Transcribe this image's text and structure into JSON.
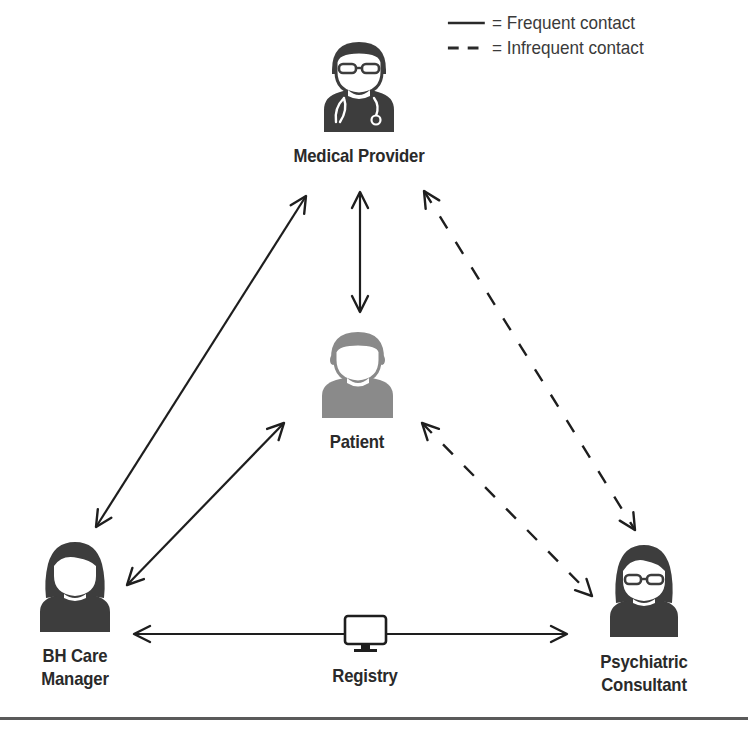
{
  "legend": {
    "items": [
      {
        "style": "solid",
        "label": "= Frequent contact"
      },
      {
        "style": "dashed",
        "label": "= Infrequent contact"
      }
    ]
  },
  "nodes": {
    "medical_provider": {
      "label": "Medical Provider",
      "icon": "doctor-with-stethoscope-icon"
    },
    "patient": {
      "label": "Patient",
      "icon": "person-icon"
    },
    "bh_care_manager": {
      "label_line1": "BH Care",
      "label_line2": "Manager",
      "icon": "woman-icon"
    },
    "psychiatric_consultant": {
      "label_line1": "Psychiatric",
      "label_line2": "Consultant",
      "icon": "woman-with-glasses-icon"
    },
    "registry": {
      "label": "Registry",
      "icon": "computer-monitor-icon"
    }
  },
  "edges": [
    {
      "from": "Medical Provider",
      "to": "Patient",
      "style": "solid",
      "direction": "bidirectional"
    },
    {
      "from": "Medical Provider",
      "to": "BH Care Manager",
      "style": "solid",
      "direction": "bidirectional"
    },
    {
      "from": "Patient",
      "to": "BH Care Manager",
      "style": "solid",
      "direction": "bidirectional"
    },
    {
      "from": "BH Care Manager",
      "to": "Psychiatric Consultant",
      "style": "solid",
      "direction": "bidirectional",
      "via": "Registry"
    },
    {
      "from": "Medical Provider",
      "to": "Psychiatric Consultant",
      "style": "dashed",
      "direction": "bidirectional"
    },
    {
      "from": "Patient",
      "to": "Psychiatric Consultant",
      "style": "dashed",
      "direction": "bidirectional"
    }
  ],
  "colors": {
    "dark_icon": "#3d3d3d",
    "patient_icon": "#8a8a8a",
    "line": "#1e1e1e",
    "text": "#2a2a2a",
    "rule": "#5a5a5a"
  }
}
